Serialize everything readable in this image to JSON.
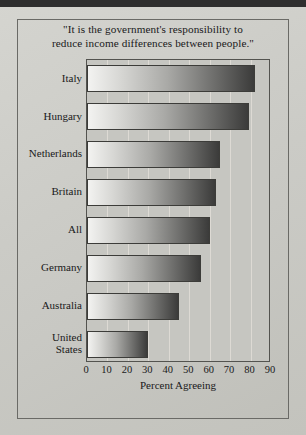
{
  "figure": {
    "background_color": "#c9c9c4",
    "frame_color": "#6a6a66"
  },
  "chart_data": {
    "type": "bar",
    "orientation": "horizontal",
    "title": "\"It is the government's responsibility to reduce income differences between people.\"",
    "title_lines": [
      "\"It is the government's responsibility to",
      "reduce income differences between people.\""
    ],
    "categories": [
      "Italy",
      "Hungary",
      "Netherlands",
      "Britain",
      "All",
      "Germany",
      "Australia",
      "United States"
    ],
    "category_label_lines": [
      [
        "Italy"
      ],
      [
        "Hungary"
      ],
      [
        "Netherlands"
      ],
      [
        "Britain"
      ],
      [
        "All"
      ],
      [
        "Germany"
      ],
      [
        "Australia"
      ],
      [
        "United",
        "States"
      ]
    ],
    "values": [
      82,
      79,
      65,
      63,
      60,
      56,
      45,
      30
    ],
    "xlabel": "Percent Agreeing",
    "ylabel": "",
    "xlim": [
      0,
      90
    ],
    "xticks": [
      0,
      10,
      20,
      30,
      40,
      50,
      60,
      70,
      80,
      90
    ],
    "xtick_labels": [
      "0",
      "10",
      "20",
      "30",
      "40",
      "50",
      "60",
      "70",
      "80",
      "90"
    ],
    "grid": true,
    "grid_axis": "x",
    "legend": null,
    "bar_gradient": {
      "from": "#f3f3f1",
      "to": "#3b3b3a",
      "direction": "left-to-right"
    },
    "bar_border_color": "#3c3c39"
  }
}
